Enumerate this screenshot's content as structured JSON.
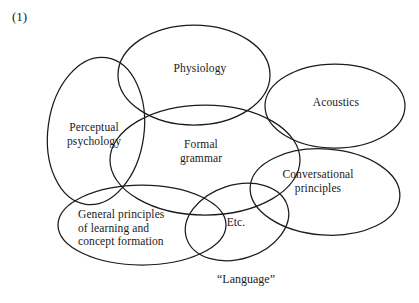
{
  "figure": {
    "number": "(1)",
    "caption": "“Language”",
    "type": "venn-diagram",
    "background_color": "#ffffff",
    "stroke_color": "#1b1b1b"
  },
  "regions": [
    {
      "id": "perceptual-psychology",
      "label": "Perceptual\npsychology",
      "shape": "ellipse",
      "cx": 96,
      "cy": 131,
      "rx": 48,
      "ry": 74,
      "rotation": 8
    },
    {
      "id": "physiology",
      "label": "Physiology",
      "shape": "ellipse",
      "cx": 194,
      "cy": 75,
      "rx": 76,
      "ry": 50,
      "rotation": 0
    },
    {
      "id": "acoustics",
      "label": "Acoustics",
      "shape": "ellipse",
      "cx": 335,
      "cy": 106,
      "rx": 70,
      "ry": 42,
      "rotation": 0
    },
    {
      "id": "formal-grammar",
      "label": "Formal\ngrammar",
      "shape": "ellipse",
      "cx": 205,
      "cy": 160,
      "rx": 95,
      "ry": 55,
      "rotation": 0
    },
    {
      "id": "conversational-principles",
      "label": "Conversational\nprinciples",
      "shape": "ellipse",
      "cx": 325,
      "cy": 192,
      "rx": 75,
      "ry": 43,
      "rotation": 4
    },
    {
      "id": "general-principles",
      "label": "General principles\nof learning and\nconcept formation",
      "shape": "ellipse",
      "cx": 142,
      "cy": 225,
      "rx": 84,
      "ry": 40,
      "rotation": 0
    },
    {
      "id": "etc",
      "label": "Etc.",
      "shape": "ellipse",
      "cx": 237,
      "cy": 222,
      "rx": 53,
      "ry": 37,
      "rotation": -18
    }
  ]
}
